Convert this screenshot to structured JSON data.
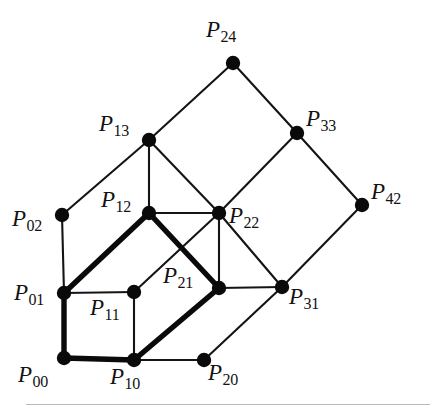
{
  "figure": {
    "kind": "lattice-graph-diagram",
    "width": 443,
    "height": 414,
    "background_color": "#ffffff",
    "ink_color": "#0a0a0a",
    "rule_color": "#b9b9b9"
  },
  "chart_data": {
    "type": "diagram",
    "title": "",
    "xlabel": "",
    "ylabel": "",
    "grid": false,
    "legend": null,
    "nodes": [
      {
        "id": "P00",
        "base": "P",
        "sub": "00",
        "x": 64,
        "y": 358,
        "label_x": 18,
        "label_y": 363
      },
      {
        "id": "P10",
        "base": "P",
        "sub": "10",
        "x": 134,
        "y": 360,
        "label_x": 110,
        "label_y": 365
      },
      {
        "id": "P20",
        "base": "P",
        "sub": "20",
        "x": 204,
        "y": 360,
        "label_x": 208,
        "label_y": 361
      },
      {
        "id": "P01",
        "base": "P",
        "sub": "01",
        "x": 64,
        "y": 293,
        "label_x": 14,
        "label_y": 281
      },
      {
        "id": "P11",
        "base": "P",
        "sub": "11",
        "x": 134,
        "y": 292,
        "label_x": 90,
        "label_y": 296
      },
      {
        "id": "P21",
        "base": "P",
        "sub": "21",
        "x": 219,
        "y": 288,
        "label_x": 163,
        "label_y": 264
      },
      {
        "id": "P31",
        "base": "P",
        "sub": "31",
        "x": 282,
        "y": 287,
        "label_x": 289,
        "label_y": 285
      },
      {
        "id": "P02",
        "base": "P",
        "sub": "02",
        "x": 62,
        "y": 215,
        "label_x": 12,
        "label_y": 207
      },
      {
        "id": "P12",
        "base": "P",
        "sub": "12",
        "x": 149,
        "y": 213,
        "label_x": 101,
        "label_y": 188
      },
      {
        "id": "P22",
        "base": "P",
        "sub": "22",
        "x": 219,
        "y": 213,
        "label_x": 229,
        "label_y": 204
      },
      {
        "id": "P42",
        "base": "P",
        "sub": "42",
        "x": 362,
        "y": 205,
        "label_x": 371,
        "label_y": 180
      },
      {
        "id": "P13",
        "base": "P",
        "sub": "13",
        "x": 149,
        "y": 140,
        "label_x": 99,
        "label_y": 112
      },
      {
        "id": "P33",
        "base": "P",
        "sub": "33",
        "x": 297,
        "y": 133,
        "label_x": 306,
        "label_y": 107
      },
      {
        "id": "P24",
        "base": "P",
        "sub": "24",
        "x": 233,
        "y": 63,
        "label_x": 206,
        "label_y": 18
      }
    ],
    "edges_thin": [
      [
        "P02",
        "P01"
      ],
      [
        "P02",
        "P13"
      ],
      [
        "P01",
        "P11"
      ],
      [
        "P11",
        "P10"
      ],
      [
        "P11",
        "P22"
      ],
      [
        "P10",
        "P20"
      ],
      [
        "P20",
        "P31"
      ],
      [
        "P21",
        "P31"
      ],
      [
        "P21",
        "P22"
      ],
      [
        "P12",
        "P22"
      ],
      [
        "P12",
        "P13"
      ],
      [
        "P13",
        "P22"
      ],
      [
        "P13",
        "P24"
      ],
      [
        "P24",
        "P33"
      ],
      [
        "P33",
        "P22"
      ],
      [
        "P33",
        "P42"
      ],
      [
        "P42",
        "P31"
      ],
      [
        "P31",
        "P22"
      ]
    ],
    "edges_bold": [
      [
        "P00",
        "P01"
      ],
      [
        "P01",
        "P12"
      ],
      [
        "P12",
        "P21"
      ],
      [
        "P21",
        "P10"
      ],
      [
        "P10",
        "P00"
      ]
    ],
    "bold_cycle_order": [
      "P00",
      "P01",
      "P12",
      "P21",
      "P10",
      "P00"
    ],
    "node_radius": 7.2,
    "bold_stroke_width": 5.4,
    "thin_stroke_width": 2.1
  },
  "bottom_rule": {
    "visible": true,
    "x": 26,
    "y": 404,
    "width": 404
  }
}
